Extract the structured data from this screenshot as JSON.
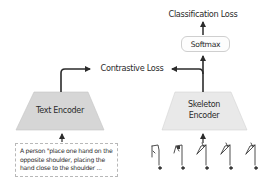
{
  "diagram": {
    "outputs": {
      "classification_loss": "Classification Loss",
      "softmax": "Softmax",
      "contrastive_loss": "Contrastive Loss"
    },
    "encoders": {
      "text_encoder": {
        "label": "Text Encoder",
        "fill": "#d6d6d6"
      },
      "skeleton_encoder": {
        "line1": "Skeleton",
        "line2": "Encoder",
        "fill": "#e8e8e8"
      }
    },
    "text_input": {
      "description": "A person \"place one hand on the opposite shoulder, placing the hand close to the shoulder ..."
    },
    "skeleton_input": {
      "frame_count": 5,
      "icon": "skeleton-pose-icon"
    },
    "colors": {
      "arrow": "#2b2b2b",
      "text": "#2b2b2b",
      "box_border": "#cfcfcf",
      "dashed_border": "#b8b8b8"
    }
  }
}
